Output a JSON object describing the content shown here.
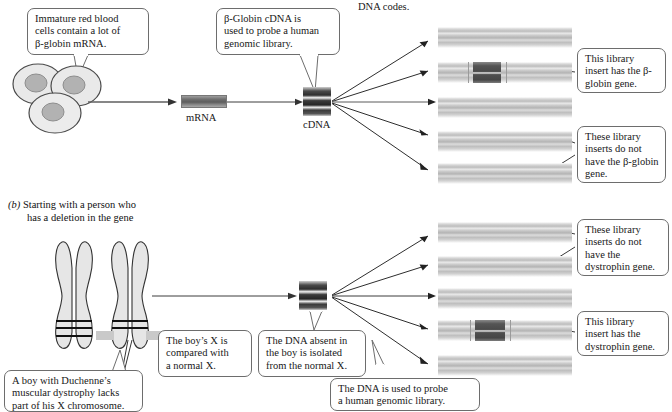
{
  "figure": {
    "top_fragment": "DNA codes.",
    "panel_a": {
      "callouts": {
        "cells": [
          "Immature red blood",
          "cells contain a lot of",
          "β-globin mRNA."
        ],
        "probe": [
          "β-Globin cDNA is",
          "used to probe a human",
          "genomic library."
        ],
        "has_gene": [
          "This  library",
          "insert has the β-",
          "globin gene."
        ],
        "no_gene": [
          "These library",
          "inserts do not",
          "have the β-globin",
          "gene."
        ]
      },
      "labels": {
        "mrna": "mRNA",
        "cdna": "cDNA"
      },
      "inserts": [
        {
          "has_gene": false
        },
        {
          "has_gene": true
        },
        {
          "has_gene": false
        },
        {
          "has_gene": false
        },
        {
          "has_gene": false
        }
      ]
    },
    "panel_b": {
      "label_marker": "(b)",
      "label_lines": [
        "Starting with a person who",
        "has a deletion in the gene"
      ],
      "callouts": {
        "duchenne": [
          "A boy with Duchenne’s",
          "muscular dystrophy lacks",
          "part of his X chromosome."
        ],
        "compared": [
          "The boy’s X is",
          "compared with",
          "a normal X."
        ],
        "isolated": [
          "The DNA absent in",
          "the boy is isolated",
          "from the normal X."
        ],
        "probe": [
          "The DNA is used to probe",
          "a human genomic library."
        ],
        "no_gene": [
          "These library",
          "inserts do not",
          "have the",
          "dystrophin gene."
        ],
        "has_gene": [
          "This library",
          "insert has the",
          "dystrophin gene."
        ]
      },
      "inserts": [
        {
          "has_gene": false
        },
        {
          "has_gene": false
        },
        {
          "has_gene": false
        },
        {
          "has_gene": true
        },
        {
          "has_gene": false
        }
      ]
    },
    "colors": {
      "gene_band": "#4a4a4a",
      "insert_band": "#c6c6c6",
      "outline": "#6d6d6d",
      "cell_fill": "#e8e8e8",
      "nucleus_fill": "#b0b0b0",
      "chromosome_fill": "#e4e4e4",
      "deletion_gray": "#c9c9c9"
    }
  }
}
